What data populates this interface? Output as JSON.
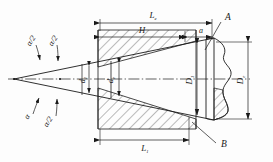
{
  "drawing": {
    "title": "Tapered shank and socket cross-section",
    "type": "engineering-section-drawing",
    "line_color": "#1a1a1a",
    "hatch_color": "#1a1a1a",
    "background": "#fdfdfd"
  },
  "dimensions": {
    "overall_taper_length": {
      "label": "L",
      "subscript": "e"
    },
    "socket_depth": {
      "label": "H",
      "subscript": ""
    },
    "gauge_offset": {
      "label": "a",
      "subscript": ""
    },
    "housing_length": {
      "label": "L",
      "subscript": "1"
    }
  },
  "diameters": {
    "small_inner": {
      "label": "d",
      "subscript": "1"
    },
    "small_end": {
      "label": "d",
      "subscript": "e"
    },
    "large_inner": {
      "label": "D",
      "subscript": "1"
    },
    "large_end": {
      "label": "D",
      "subscript": "e"
    }
  },
  "angles": {
    "full_angle_top": {
      "label": "α",
      "subscript": ""
    },
    "half_angle_top": {
      "label": "α/2",
      "subscript": ""
    },
    "full_angle_bottom": {
      "label": "α",
      "subscript": ""
    },
    "half_angle_bottom": {
      "label": "α/2",
      "subscript": ""
    }
  },
  "callouts": {
    "upper": {
      "label": "A"
    },
    "lower": {
      "label": "B"
    }
  }
}
